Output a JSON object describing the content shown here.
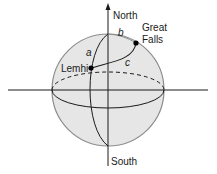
{
  "diagram": {
    "type": "sphere-geometry",
    "labels": {
      "north": "North",
      "south": "South",
      "great_falls_line1": "Great",
      "great_falls_line2": "Falls",
      "lemhi": "Lemhi",
      "side_a": "a",
      "side_b": "b",
      "side_c": "c"
    },
    "points": [
      {
        "name": "Lemhi"
      },
      {
        "name": "Great Falls"
      }
    ],
    "colors": {
      "sphere_fill": "#e6e6e6",
      "sphere_stroke": "#8c8c8c",
      "line": "#1a1a1a",
      "background": "#ffffff"
    }
  }
}
